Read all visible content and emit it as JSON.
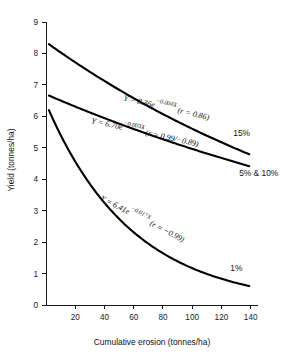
{
  "chart_data": {
    "type": "line",
    "title": "",
    "subtitle": "",
    "xlabel": "Cumulative erosion (tonnes/ha)",
    "ylabel": "Yield (tonnes/ha)",
    "xlim": [
      0,
      145
    ],
    "ylim": [
      0,
      9
    ],
    "xticks": [
      20,
      40,
      60,
      80,
      100,
      120,
      140
    ],
    "xtick_labels": [
      "20",
      "40",
      "60",
      "80",
      "100",
      "120",
      "140"
    ],
    "yticks": [
      0,
      1,
      2,
      3,
      4,
      5,
      6,
      7,
      8,
      9
    ],
    "ytick_labels": [
      "0",
      "1",
      "2",
      "3",
      "4",
      "5",
      "6",
      "7",
      "8",
      "9"
    ],
    "grid": false,
    "legend_position": "inline-right",
    "curve_color": "#000000",
    "axis_color": "#1a1a1a",
    "series": [
      {
        "name": "15%",
        "label": "15%",
        "amplitude": 8.36,
        "rate": -0.004,
        "r": "0.86",
        "x_start": 2,
        "x_end": 139,
        "y_start": 8.29,
        "y_end": 4.79,
        "x": [
          2,
          20,
          40,
          60,
          80,
          100,
          120,
          139
        ],
        "y": [
          8.29,
          7.72,
          7.13,
          6.58,
          6.07,
          5.61,
          5.17,
          4.79
        ],
        "equation_parts": {
          "prefix": "Y = 8.36e",
          "exponent": "−0.004X",
          "suffix": " (r = 0.86)"
        },
        "equation_text": "Y = 8.36e−0.004X (r = 0.86)"
      },
      {
        "name": "5% & 10%",
        "label": "5% & 10%",
        "amplitude": 6.7,
        "rate": -0.003,
        "r": "0.99/−0.89",
        "x_start": 2,
        "x_end": 139,
        "y_start": 6.66,
        "y_end": 4.41,
        "x": [
          2,
          20,
          40,
          60,
          80,
          100,
          120,
          139
        ],
        "y": [
          6.66,
          6.31,
          5.94,
          5.6,
          5.27,
          4.96,
          4.68,
          4.41
        ],
        "equation_parts": {
          "prefix": "Y = 6.70e",
          "exponent": "−0.003X",
          "suffix": " (r = 0.99/−0.89)"
        },
        "equation_text": "Y = 6.70e−0.003X (r = 0.99/−0.89)"
      },
      {
        "name": "1%",
        "label": "1%",
        "amplitude": 6.41,
        "rate": -0.017,
        "r": "−0.99",
        "x_start": 2,
        "x_end": 139,
        "y_start": 6.2,
        "y_end": 0.71,
        "x": [
          2,
          20,
          40,
          60,
          80,
          100,
          120,
          139
        ],
        "y": [
          6.2,
          4.56,
          3.25,
          2.31,
          1.65,
          1.17,
          0.83,
          0.62
        ],
        "equation_parts": {
          "prefix": "Y = 6.41e",
          "exponent": "−0.017X",
          "suffix": " (r = −0.99)"
        },
        "equation_text": "Y = 6.41e−0.017X (r = −0.99)"
      }
    ]
  }
}
